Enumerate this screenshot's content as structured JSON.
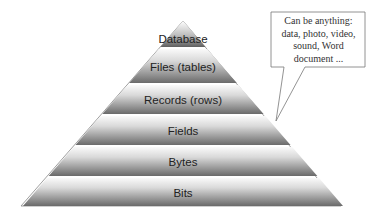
{
  "diagram": {
    "type": "pyramid",
    "layers": [
      {
        "label": "Database"
      },
      {
        "label": "Files (tables)"
      },
      {
        "label": "Records (rows)"
      },
      {
        "label": "Fields"
      },
      {
        "label": "Bytes"
      },
      {
        "label": "Bits"
      }
    ],
    "callout": {
      "lines": [
        "Can be anything:",
        "data, photo, video,",
        "sound, Word",
        "document ..."
      ]
    },
    "colors": {
      "band_top": "#f2f2f2",
      "band_bottom": "#6e6e6e",
      "outline": "#555555",
      "callout_border": "#777777"
    }
  }
}
